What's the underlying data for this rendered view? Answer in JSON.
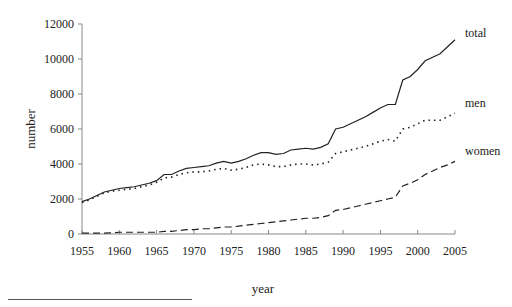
{
  "chart_data": {
    "type": "line",
    "title": "",
    "xlabel": "year",
    "ylabel": "number",
    "xlim": [
      1955,
      2005
    ],
    "ylim": [
      0,
      12000
    ],
    "x_ticks": [
      1955,
      1960,
      1965,
      1970,
      1975,
      1980,
      1985,
      1990,
      1995,
      2000,
      2005
    ],
    "y_ticks": [
      0,
      2000,
      4000,
      6000,
      8000,
      10000,
      12000
    ],
    "grid": false,
    "legend_position": "inline-right",
    "x": [
      1955,
      1956,
      1957,
      1958,
      1959,
      1960,
      1961,
      1962,
      1963,
      1964,
      1965,
      1966,
      1967,
      1968,
      1969,
      1970,
      1971,
      1972,
      1973,
      1974,
      1975,
      1976,
      1977,
      1978,
      1979,
      1980,
      1981,
      1982,
      1983,
      1984,
      1985,
      1986,
      1987,
      1988,
      1989,
      1990,
      1991,
      1992,
      1993,
      1994,
      1995,
      1996,
      1997,
      1998,
      1999,
      2000,
      2001,
      2002,
      2003,
      2004,
      2005
    ],
    "series": [
      {
        "name": "total",
        "style": "solid",
        "values": [
          1850,
          2000,
          2200,
          2400,
          2500,
          2600,
          2650,
          2700,
          2800,
          2900,
          3050,
          3400,
          3400,
          3600,
          3750,
          3800,
          3850,
          3900,
          4050,
          4150,
          4050,
          4150,
          4300,
          4500,
          4650,
          4650,
          4550,
          4600,
          4800,
          4850,
          4900,
          4850,
          4950,
          5150,
          6000,
          6100,
          6300,
          6500,
          6700,
          6950,
          7200,
          7400,
          7400,
          8800,
          9000,
          9400,
          9900,
          10100,
          10300,
          10700,
          11100
        ]
      },
      {
        "name": "men",
        "style": "dotted",
        "values": [
          1800,
          1950,
          2150,
          2350,
          2450,
          2500,
          2550,
          2600,
          2700,
          2800,
          2950,
          3200,
          3250,
          3400,
          3500,
          3550,
          3550,
          3600,
          3700,
          3750,
          3650,
          3700,
          3800,
          3950,
          4000,
          3950,
          3850,
          3850,
          3950,
          4000,
          4000,
          3950,
          4000,
          4100,
          4600,
          4700,
          4800,
          4900,
          5000,
          5150,
          5300,
          5400,
          5300,
          6000,
          6100,
          6300,
          6500,
          6500,
          6500,
          6700,
          6900
        ]
      },
      {
        "name": "women",
        "style": "dashed",
        "values": [
          50,
          50,
          50,
          50,
          60,
          100,
          100,
          100,
          100,
          100,
          100,
          150,
          150,
          200,
          250,
          250,
          300,
          300,
          350,
          400,
          400,
          450,
          500,
          550,
          600,
          650,
          700,
          750,
          800,
          850,
          900,
          900,
          950,
          1050,
          1350,
          1400,
          1500,
          1600,
          1700,
          1800,
          1900,
          2000,
          2100,
          2750,
          2900,
          3100,
          3400,
          3600,
          3800,
          3950,
          4150
        ]
      }
    ]
  }
}
